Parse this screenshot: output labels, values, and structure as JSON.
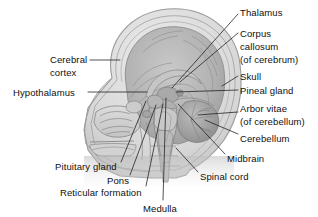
{
  "figure": {
    "kind": "anatomical-illustration",
    "style": "grayscale medical line drawing with shading",
    "colors": {
      "background": "#ffffff",
      "text": "#101010",
      "leader_line": "#1a1a1a",
      "skull_outline": "#8e8e8e",
      "skull_fill": "#d8d8d8",
      "brain_fill": "#b4b4b4",
      "brain_shadow": "#9a9a9a",
      "cerebellum_fill": "#a8a8a8",
      "brainstem_fill": "#c2c2c2",
      "face_fill": "#cfcfcf"
    }
  },
  "labels": [
    {
      "id": "thalamus",
      "text": "Thalamus",
      "side": "right",
      "x": 240,
      "y": 8,
      "leader": {
        "x1": 238,
        "y1": 14,
        "x2": 172,
        "y2": 88
      }
    },
    {
      "id": "corpus-callosum",
      "text": "Corpus",
      "side": "right",
      "x": 240,
      "y": 29,
      "leader": {
        "x1": 238,
        "y1": 33,
        "x2": 180,
        "y2": 82
      }
    },
    {
      "id": "corpus-callosum-2",
      "text": "callosum",
      "side": "right",
      "x": 240,
      "y": 42,
      "leader": null
    },
    {
      "id": "corpus-callosum-3",
      "text": "(of cerebrum)",
      "side": "right",
      "x": 240,
      "y": 55,
      "leader": null
    },
    {
      "id": "skull",
      "text": "Skull",
      "side": "right",
      "x": 240,
      "y": 72,
      "leader": {
        "x1": 238,
        "y1": 76,
        "x2": 222,
        "y2": 86
      }
    },
    {
      "id": "pineal-gland",
      "text": "Pineal gland",
      "side": "right",
      "x": 240,
      "y": 86,
      "leader": {
        "x1": 238,
        "y1": 90,
        "x2": 176,
        "y2": 92
      }
    },
    {
      "id": "arbor-vitae",
      "text": "Arbor vitae",
      "side": "right",
      "x": 240,
      "y": 104,
      "leader": {
        "x1": 238,
        "y1": 112,
        "x2": 198,
        "y2": 115
      }
    },
    {
      "id": "arbor-vitae-2",
      "text": "(of cerebellum)",
      "side": "right",
      "x": 240,
      "y": 117,
      "leader": null
    },
    {
      "id": "cerebellum",
      "text": "Cerebellum",
      "side": "right",
      "x": 240,
      "y": 134,
      "leader": {
        "x1": 238,
        "y1": 134,
        "x2": 205,
        "y2": 120
      }
    },
    {
      "id": "midbrain",
      "text": "Midbrain",
      "side": "right",
      "x": 227,
      "y": 154,
      "leader": {
        "x1": 225,
        "y1": 154,
        "x2": 178,
        "y2": 104
      }
    },
    {
      "id": "spinal-cord",
      "text": "Spinal cord",
      "side": "right",
      "x": 200,
      "y": 172,
      "leader": {
        "x1": 198,
        "y1": 172,
        "x2": 176,
        "y2": 148
      }
    },
    {
      "id": "cerebral-cortex",
      "text": "Cerebral",
      "side": "left",
      "x": 50,
      "y": 55,
      "leader": {
        "x1": 90,
        "y1": 60,
        "x2": 120,
        "y2": 60
      }
    },
    {
      "id": "cerebral-cortex-2",
      "text": "cortex",
      "side": "left",
      "x": 50,
      "y": 68,
      "leader": null
    },
    {
      "id": "hypothalamus",
      "text": "Hypothalamus",
      "side": "left",
      "x": 13,
      "y": 88,
      "leader": {
        "x1": 88,
        "y1": 92,
        "x2": 147,
        "y2": 92
      }
    },
    {
      "id": "pituitary-gland",
      "text": "Pituitary gland",
      "side": "left",
      "x": 55,
      "y": 162,
      "leader": {
        "x1": 121,
        "y1": 162,
        "x2": 146,
        "y2": 101
      }
    },
    {
      "id": "pons",
      "text": "Pons",
      "side": "left",
      "x": 107,
      "y": 176,
      "leader": {
        "x1": 130,
        "y1": 175,
        "x2": 156,
        "y2": 105
      }
    },
    {
      "id": "reticular-formation",
      "text": "Reticular formation",
      "side": "left",
      "x": 60,
      "y": 188,
      "leader": {
        "x1": 146,
        "y1": 186,
        "x2": 163,
        "y2": 104
      }
    },
    {
      "id": "medulla",
      "text": "Medulla",
      "side": "center",
      "x": 143,
      "y": 204,
      "leader": {
        "x1": 163,
        "y1": 200,
        "x2": 166,
        "y2": 98
      }
    }
  ]
}
